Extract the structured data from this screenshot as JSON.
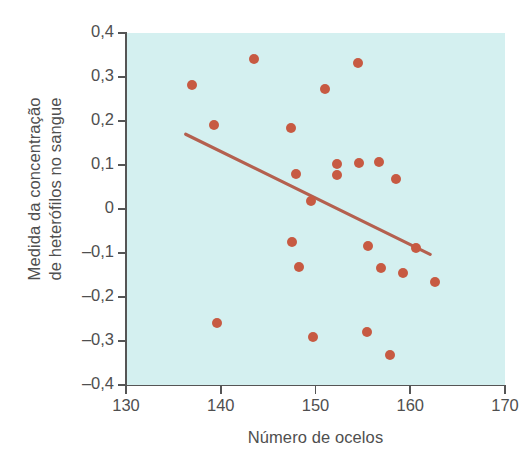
{
  "chart_data": {
    "type": "scatter",
    "title": "",
    "xlabel": "Número de ocelos",
    "ylabel": "Medida da concentração de heterófilos no sangue",
    "ylabel_lines": [
      "Medida da concentração",
      "de heterófilos no sangue"
    ],
    "xlim": [
      130,
      170
    ],
    "ylim": [
      -0.4,
      0.4
    ],
    "xticks": [
      130,
      140,
      150,
      160,
      170
    ],
    "xticklabels": [
      "130",
      "140",
      "150",
      "160",
      "170"
    ],
    "yticks": [
      0.4,
      0.3,
      0.2,
      0.1,
      0,
      -0.1,
      -0.2,
      -0.3,
      -0.4
    ],
    "yticklabels": [
      "0,4",
      "0,3",
      "0,2",
      "0,1",
      "0",
      "–0,1",
      "–0,2",
      "–0,3",
      "–0,4"
    ],
    "grid": false,
    "legend": null,
    "decimal_separator": ",",
    "point_color": "#c75a42",
    "line_color": "#b4604f",
    "plot_background": "#d4f0f0",
    "axis_color": "#555555",
    "points": [
      {
        "x": 137.0,
        "y": 0.281
      },
      {
        "x": 139.3,
        "y": 0.191
      },
      {
        "x": 139.6,
        "y": -0.26
      },
      {
        "x": 143.5,
        "y": 0.342
      },
      {
        "x": 147.4,
        "y": 0.183
      },
      {
        "x": 147.5,
        "y": -0.076
      },
      {
        "x": 147.9,
        "y": 0.08
      },
      {
        "x": 148.3,
        "y": -0.131
      },
      {
        "x": 149.5,
        "y": 0.018
      },
      {
        "x": 149.7,
        "y": -0.291
      },
      {
        "x": 151.0,
        "y": 0.273
      },
      {
        "x": 152.3,
        "y": 0.103
      },
      {
        "x": 152.3,
        "y": 0.078
      },
      {
        "x": 154.5,
        "y": 0.331
      },
      {
        "x": 154.6,
        "y": 0.105
      },
      {
        "x": 155.4,
        "y": -0.28
      },
      {
        "x": 155.5,
        "y": -0.084
      },
      {
        "x": 156.7,
        "y": 0.106
      },
      {
        "x": 156.9,
        "y": -0.133
      },
      {
        "x": 157.9,
        "y": -0.331
      },
      {
        "x": 158.5,
        "y": 0.068
      },
      {
        "x": 159.2,
        "y": -0.146
      },
      {
        "x": 160.6,
        "y": -0.089
      },
      {
        "x": 162.6,
        "y": -0.167
      }
    ],
    "trendline": {
      "x1": 136.3,
      "y1": 0.17,
      "x2": 162.1,
      "y2": -0.103
    }
  }
}
